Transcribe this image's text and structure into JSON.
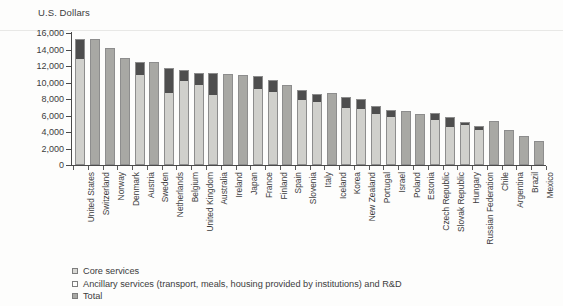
{
  "chart_data": {
    "type": "bar",
    "title": "",
    "subtitle": "",
    "ylabel": "U.S. Dollars",
    "xlabel": "",
    "ylim": [
      0,
      16000
    ],
    "ytick_labels": [
      "16,000",
      "14,000",
      "12,000",
      "10,000",
      "8,000",
      "6,000",
      "4,000",
      "2,000",
      "0"
    ],
    "ytick_values": [
      16000,
      14000,
      12000,
      10000,
      8000,
      6000,
      4000,
      2000,
      0
    ],
    "grid": false,
    "stacked": true,
    "legend_position": "bottom-left",
    "categories": [
      "United States",
      "Switzerland",
      "Norway",
      "Denmark",
      "Austria",
      "Sweden",
      "Netherlands",
      "Belgium",
      "United Kingdom",
      "Australia",
      "Ireland",
      "Japan",
      "France",
      "Finland",
      "Spain",
      "Slovenia",
      "Italy",
      "Iceland",
      "Korea",
      "New Zealand",
      "Portugal",
      "Israel",
      "Poland",
      "Estonia",
      "Czech Republic",
      "Slovak Republic",
      "Hungary",
      "Russian Federation",
      "Chile",
      "Argentina",
      "Brazil",
      "Mexico"
    ],
    "series": [
      {
        "name": "Core services",
        "key": "core",
        "color": "#d0d0cc",
        "values": [
          13000,
          null,
          null,
          null,
          11000,
          null,
          8900,
          10300,
          9850,
          8550,
          null,
          null,
          9350,
          9000,
          null,
          8050,
          7700,
          null,
          7000,
          6950,
          6350,
          5950,
          null,
          null,
          5600,
          4750,
          4950,
          4400,
          null,
          null,
          null,
          null
        ]
      },
      {
        "name": "Ancillary services (transport, meals, housing provided by institutions) and R&D",
        "key": "ancillary",
        "color": "#4e4e4e",
        "values": [
          2300,
          null,
          null,
          null,
          1500,
          null,
          2800,
          1200,
          1350,
          2550,
          null,
          null,
          1400,
          1350,
          null,
          1050,
          950,
          null,
          1200,
          1000,
          800,
          750,
          null,
          null,
          700,
          1050,
          300,
          300,
          null,
          null,
          null,
          null
        ]
      },
      {
        "name": "Total",
        "key": "total",
        "color": "#a8a8a4",
        "values": [
          null,
          15250,
          14150,
          12950,
          null,
          12500,
          null,
          null,
          null,
          null,
          11000,
          10900,
          null,
          null,
          9700,
          null,
          null,
          8700,
          null,
          null,
          null,
          null,
          6550,
          6200,
          null,
          null,
          null,
          null,
          5350,
          4200,
          3500,
          2900
        ]
      }
    ],
    "bar_totals": [
      15300,
      15250,
      14150,
      12950,
      12500,
      12500,
      11700,
      11500,
      11200,
      11100,
      11000,
      10900,
      10750,
      10350,
      9700,
      9100,
      8650,
      8700,
      8200,
      7950,
      7150,
      6700,
      6550,
      6200,
      6300,
      5800,
      5250,
      4700,
      5350,
      4200,
      3500,
      2900
    ]
  },
  "legend": {
    "items": [
      {
        "label": "Core services",
        "key": "core"
      },
      {
        "label": "Ancillary services (transport, meals, housing provided by institutions) and R&D",
        "key": "ancillary"
      },
      {
        "label": "Total",
        "key": "total"
      }
    ]
  }
}
